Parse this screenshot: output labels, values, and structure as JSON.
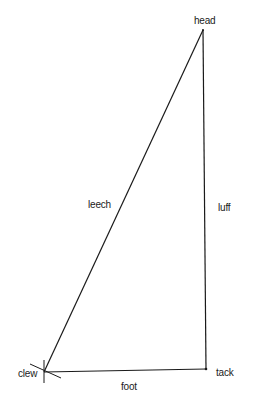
{
  "diagram": {
    "type": "sail-parts",
    "shape": "right triangle",
    "stroke_color": "#1a1a1a",
    "background": "#ffffff",
    "corners": [
      {
        "id": "head",
        "label": "head"
      },
      {
        "id": "clew",
        "label": "clew"
      },
      {
        "id": "tack",
        "label": "tack"
      }
    ],
    "edges": [
      {
        "id": "leech",
        "label": "leech",
        "from": "head",
        "to": "clew"
      },
      {
        "id": "luff",
        "label": "luff",
        "from": "head",
        "to": "tack"
      },
      {
        "id": "foot",
        "label": "foot",
        "from": "clew",
        "to": "tack"
      }
    ]
  },
  "labels": {
    "head": "head",
    "clew": "clew",
    "tack": "tack",
    "leech": "leech",
    "luff": "luff",
    "foot": "foot"
  },
  "caption": ""
}
